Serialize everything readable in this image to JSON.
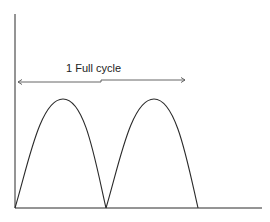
{
  "diagram": {
    "annotation": "1 Full cycle",
    "colors": {
      "stroke": "#2a2a2a",
      "arrow": "#555555",
      "background": "#ffffff"
    },
    "axes": {
      "y_axis": {
        "x": 15,
        "y_top": 14,
        "y_bottom": 208
      },
      "x_axis": {
        "y": 208,
        "x_left": 15,
        "x_right": 262
      }
    },
    "waveform": {
      "type": "full-wave rectified sine",
      "humps": [
        {
          "start_x": 15,
          "peak_x": 65,
          "end_x": 106,
          "peak_y": 99
        },
        {
          "start_x": 106,
          "peak_x": 156,
          "end_x": 198,
          "peak_y": 99
        }
      ]
    },
    "cycle_arrow": {
      "x_start": 17,
      "x_end": 186,
      "y": 81
    }
  }
}
